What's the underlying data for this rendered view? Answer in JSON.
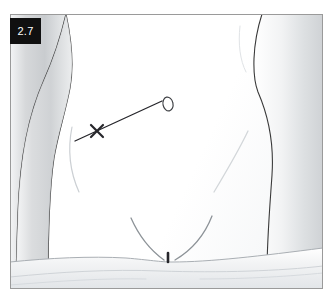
{
  "figure": {
    "label": "2.7",
    "domain_type": "clinical-illustration",
    "frame": {
      "border_color": "#9a9a9a",
      "background_color": "#ffffff",
      "x": 10,
      "y": 14,
      "width": 313,
      "height": 275
    },
    "label_badge": {
      "text": "2.7",
      "background_color": "#101010",
      "text_color": "#ffffff",
      "x": 10,
      "y": 18,
      "width": 31,
      "height": 26
    }
  },
  "palette": {
    "outline": "#3a3a3a",
    "skin_light": "#fdfdfd",
    "skin_shade": "#d2d4d6",
    "skin_mid": "#e6e8ea",
    "faint_contour": "#c9cdd1",
    "drape_shade": "#dfe2e5",
    "mark_ink": "#26262b",
    "frame_line": "#9a9a9a"
  },
  "anatomy": {
    "parts": [
      {
        "name": "left-arm",
        "label": "Patient's left arm at image left, shaded vertical band"
      },
      {
        "name": "torso-right-flank",
        "label": "Right flank and waist contour at image right"
      },
      {
        "name": "abdomen",
        "label": "Central anterior abdominal wall, unshaded"
      },
      {
        "name": "inguinal-crease-left",
        "label": "Left inguinal (groin) crease, V-shaped"
      },
      {
        "name": "inguinal-crease-right",
        "label": "Right inguinal (groin) crease, V-shaped"
      },
      {
        "name": "pubic-mark",
        "label": "Small dark vertical mark at pubic midline"
      },
      {
        "name": "drape-sheet",
        "label": "Draped sheet across lower abdomen with fold lines"
      },
      {
        "name": "flank-contour-left",
        "label": "Faint curved contour of left lower abdomen"
      },
      {
        "name": "flank-contour-right",
        "label": "Faint curved contour of right lower abdomen"
      }
    ]
  },
  "markings": {
    "items": [
      {
        "name": "incision-line",
        "label": "Planned oblique incision line",
        "start": {
          "x": 75,
          "y": 141
        },
        "end": {
          "x": 162,
          "y": 101
        },
        "color": "#26262b"
      },
      {
        "name": "x-marker",
        "label": "X mark on the incision line",
        "center": {
          "x": 97,
          "y": 131
        },
        "color": "#26262b"
      },
      {
        "name": "lesion-oval",
        "label": "Small oval outline of lesion at upper end of line",
        "center": {
          "x": 168,
          "y": 104
        },
        "rx": 5,
        "ry": 7,
        "color": "#3a3a3a"
      }
    ]
  }
}
